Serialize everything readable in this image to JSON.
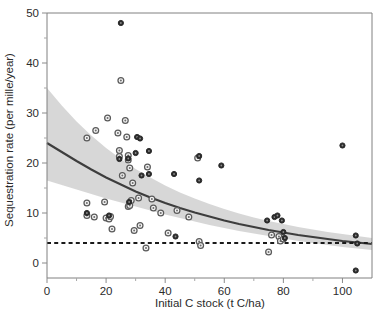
{
  "chart_data": {
    "type": "scatter",
    "title": "",
    "xlabel": "Initial C stock (t C/ha)",
    "ylabel": "Sequestration rate (per mille/year)",
    "xlim": [
      0,
      110
    ],
    "ylim": [
      -3,
      50
    ],
    "xticks": [
      0,
      20,
      40,
      60,
      80,
      100
    ],
    "xtick_labels": [
      "0",
      "20",
      "40",
      "60",
      "80",
      "100"
    ],
    "yticks": [
      0,
      10,
      20,
      30,
      40,
      50
    ],
    "ytick_labels": [
      "0",
      "10",
      "20",
      "30",
      "40",
      "50"
    ],
    "grid": false,
    "legend": false,
    "series": [
      {
        "name": "open-circle-observations",
        "marker": "open-circle",
        "points": [
          [
            13.5,
            25.0
          ],
          [
            13.5,
            12.0
          ],
          [
            13.5,
            9.5
          ],
          [
            16.0,
            9.2
          ],
          [
            16.5,
            26.5
          ],
          [
            19.5,
            12.2
          ],
          [
            20.0,
            9.0
          ],
          [
            20.5,
            29.0
          ],
          [
            21.0,
            8.8
          ],
          [
            21.5,
            9.3
          ],
          [
            22.0,
            6.8
          ],
          [
            24.0,
            26.0
          ],
          [
            24.5,
            22.5
          ],
          [
            24.5,
            21.3
          ],
          [
            25.0,
            36.5
          ],
          [
            25.5,
            17.5
          ],
          [
            26.5,
            28.5
          ],
          [
            27.0,
            25.2
          ],
          [
            27.5,
            21.5
          ],
          [
            27.5,
            20.6
          ],
          [
            27.5,
            11.3
          ],
          [
            28.0,
            11.5
          ],
          [
            28.0,
            19.0
          ],
          [
            28.5,
            12.5
          ],
          [
            29.0,
            16.0
          ],
          [
            29.5,
            6.5
          ],
          [
            31.0,
            13.0
          ],
          [
            31.5,
            7.5
          ],
          [
            33.5,
            3.0
          ],
          [
            34.0,
            19.2
          ],
          [
            35.5,
            12.8
          ],
          [
            36.0,
            11.0
          ],
          [
            38.5,
            10.0
          ],
          [
            41.0,
            6.0
          ],
          [
            44.0,
            10.5
          ],
          [
            48.0,
            9.2
          ],
          [
            51.0,
            21.0
          ],
          [
            51.5,
            4.3
          ],
          [
            52.0,
            3.5
          ],
          [
            75.0,
            2.2
          ],
          [
            76.0,
            5.6
          ],
          [
            78.5,
            5.3
          ],
          [
            79.0,
            4.4
          ],
          [
            80.0,
            4.8
          ]
        ]
      },
      {
        "name": "filled-circle-observations",
        "marker": "filled-circle",
        "points": [
          [
            13.5,
            10.0
          ],
          [
            21.0,
            9.5
          ],
          [
            24.5,
            20.8
          ],
          [
            27.5,
            20.9
          ],
          [
            27.8,
            12.2
          ],
          [
            30.0,
            22.0
          ],
          [
            30.5,
            25.2
          ],
          [
            32.0,
            17.5
          ],
          [
            34.5,
            22.4
          ],
          [
            34.5,
            17.8
          ],
          [
            43.0,
            17.8
          ],
          [
            43.5,
            5.3
          ],
          [
            25.0,
            48.0
          ],
          [
            31.5,
            24.9
          ],
          [
            51.5,
            21.4
          ],
          [
            51.5,
            16.5
          ],
          [
            59.0,
            19.5
          ],
          [
            74.5,
            8.5
          ],
          [
            77.0,
            9.2
          ],
          [
            78.0,
            9.5
          ],
          [
            79.5,
            8.5
          ],
          [
            80.0,
            6.2
          ],
          [
            80.5,
            5.0
          ],
          [
            100.0,
            23.5
          ],
          [
            104.5,
            5.5
          ],
          [
            105.0,
            3.9
          ],
          [
            104.5,
            -1.5
          ]
        ]
      }
    ],
    "fit_curve": {
      "name": "exponential-decay-fit",
      "points": [
        [
          0,
          24.0
        ],
        [
          5,
          22.2
        ],
        [
          10,
          20.4
        ],
        [
          15,
          18.7
        ],
        [
          20,
          17.1
        ],
        [
          25,
          15.7
        ],
        [
          30,
          14.3
        ],
        [
          35,
          13.1
        ],
        [
          40,
          12.0
        ],
        [
          45,
          11.0
        ],
        [
          50,
          10.1
        ],
        [
          55,
          9.3
        ],
        [
          60,
          8.5
        ],
        [
          65,
          7.8
        ],
        [
          70,
          7.2
        ],
        [
          75,
          6.6
        ],
        [
          80,
          6.1
        ],
        [
          85,
          5.6
        ],
        [
          90,
          5.2
        ],
        [
          95,
          4.8
        ],
        [
          100,
          4.4
        ],
        [
          105,
          4.1
        ],
        [
          110,
          3.8
        ]
      ]
    },
    "confidence_band": {
      "name": "95-percent-confidence-interval",
      "upper": [
        [
          0,
          35.0
        ],
        [
          5,
          31.5
        ],
        [
          10,
          28.3
        ],
        [
          15,
          25.5
        ],
        [
          20,
          23.0
        ],
        [
          25,
          20.8
        ],
        [
          30,
          18.8
        ],
        [
          35,
          17.1
        ],
        [
          40,
          15.5
        ],
        [
          45,
          14.1
        ],
        [
          50,
          12.9
        ],
        [
          55,
          11.8
        ],
        [
          60,
          10.8
        ],
        [
          65,
          9.9
        ],
        [
          70,
          9.1
        ],
        [
          75,
          8.4
        ],
        [
          80,
          7.8
        ],
        [
          85,
          7.2
        ],
        [
          90,
          6.7
        ],
        [
          95,
          6.2
        ],
        [
          100,
          5.8
        ],
        [
          105,
          5.4
        ],
        [
          110,
          5.0
        ]
      ],
      "lower": [
        [
          0,
          16.5
        ],
        [
          5,
          15.6
        ],
        [
          10,
          14.7
        ],
        [
          15,
          13.8
        ],
        [
          20,
          12.9
        ],
        [
          25,
          12.1
        ],
        [
          30,
          11.3
        ],
        [
          35,
          10.5
        ],
        [
          40,
          9.7
        ],
        [
          45,
          9.0
        ],
        [
          50,
          8.3
        ],
        [
          55,
          7.6
        ],
        [
          60,
          7.0
        ],
        [
          65,
          6.4
        ],
        [
          70,
          5.9
        ],
        [
          75,
          5.4
        ],
        [
          80,
          4.9
        ],
        [
          85,
          4.4
        ],
        [
          90,
          4.0
        ],
        [
          95,
          3.6
        ],
        [
          100,
          3.2
        ],
        [
          105,
          2.9
        ],
        [
          110,
          2.6
        ]
      ]
    },
    "reference_line": {
      "name": "baseline-threshold",
      "style": "dashed",
      "y": 4.0,
      "x_from": 0,
      "x_to": 110
    }
  }
}
